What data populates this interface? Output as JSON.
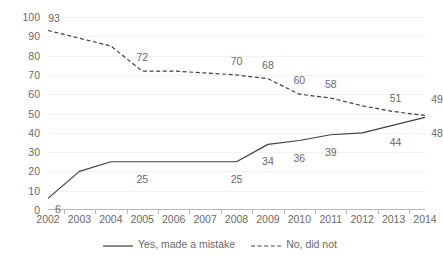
{
  "chart_data": {
    "type": "line",
    "title": "",
    "subtitle": "",
    "xlabel": "",
    "ylabel": "",
    "categories": [
      "2002",
      "2003",
      "2004",
      "2005",
      "2006",
      "2007",
      "2008",
      "2009",
      "2010",
      "2011",
      "2012",
      "2013",
      "2014"
    ],
    "ylim": [
      0,
      100
    ],
    "ytick_step": 10,
    "yticks": [
      "100",
      "90",
      "80",
      "70",
      "60",
      "50",
      "40",
      "30",
      "20",
      "10",
      "0"
    ],
    "grid": true,
    "legend_position": "bottom-center",
    "series": [
      {
        "name": "Yes, made a mistake",
        "style": "solid",
        "color": "#404040",
        "values": [
          6,
          20,
          25,
          25,
          25,
          25,
          25,
          34,
          36,
          39,
          40,
          44,
          48
        ],
        "labels": [
          {
            "category": "2002",
            "value": 6,
            "text": "6"
          },
          {
            "category": "2005",
            "value": 25,
            "text": "25"
          },
          {
            "category": "2008",
            "value": 25,
            "text": "25"
          },
          {
            "category": "2009",
            "value": 34,
            "text": "34"
          },
          {
            "category": "2010",
            "value": 36,
            "text": "36"
          },
          {
            "category": "2011",
            "value": 39,
            "text": "39"
          },
          {
            "category": "2013",
            "value": 44,
            "text": "44"
          },
          {
            "category": "2014",
            "value": 48,
            "text": "48"
          }
        ]
      },
      {
        "name": "No, did not",
        "style": "dashed",
        "color": "#404040",
        "values": [
          93,
          89,
          85,
          72,
          72,
          71,
          70,
          68,
          60,
          58,
          54,
          51,
          49
        ],
        "labels": [
          {
            "category": "2002",
            "value": 93,
            "text": "93"
          },
          {
            "category": "2005",
            "value": 72,
            "text": "72"
          },
          {
            "category": "2008",
            "value": 70,
            "text": "70"
          },
          {
            "category": "2009",
            "value": 68,
            "text": "68"
          },
          {
            "category": "2010",
            "value": 60,
            "text": "60"
          },
          {
            "category": "2011",
            "value": 58,
            "text": "58"
          },
          {
            "category": "2013",
            "value": 51,
            "text": "51"
          },
          {
            "category": "2014",
            "value": 49,
            "text": "49"
          }
        ]
      }
    ]
  },
  "legend": {
    "items": [
      {
        "label": "Yes, made a mistake",
        "style": "solid"
      },
      {
        "label": "No, did not",
        "style": "dashed"
      }
    ]
  },
  "colors": {
    "axis": "#b9b9b9",
    "grid": "#f2f2f2",
    "text": "#6a6a6a",
    "line": "#404040",
    "background": "#ffffff"
  }
}
